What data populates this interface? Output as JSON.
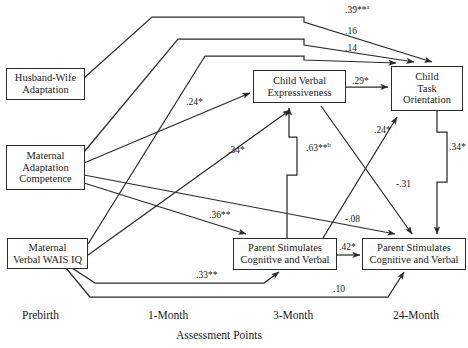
{
  "figure": {
    "type": "path-diagram",
    "axis_title": "Assessment Points",
    "axis_points": [
      {
        "label": "Prebirth",
        "x": 48
      },
      {
        "label": "1-Month",
        "x": 175
      },
      {
        "label": "3-Month",
        "x": 300
      },
      {
        "label": "24-Month",
        "x": 424
      }
    ]
  },
  "nodes": {
    "husband_wife": "Husband-Wife\nAdaptation",
    "maternal_adaptation": "Maternal\nAdaptation\nCompetence",
    "maternal_wais": "Maternal\nVerbal WAIS IQ",
    "child_verbal": "Child Verbal\nExpressiveness",
    "child_task": "Child\nTask\nOrientation",
    "parent_stim_3mo": "Parent Stimulates\nCognitive and Verbal",
    "parent_stim_24mo": "Parent Stimulates\nCognitive and Verbal"
  },
  "paths": [
    {
      "id": "hw-to-task",
      "coefficient": ".39",
      "stars": "**",
      "note": "a",
      "from": "husband_wife",
      "to": "child_task"
    },
    {
      "id": "madapt-to-task",
      "coefficient": ".16",
      "stars": "",
      "note": "",
      "from": "maternal_adaptation",
      "to": "child_task"
    },
    {
      "id": "wais-to-task",
      "coefficient": ".14",
      "stars": "",
      "note": "",
      "from": "maternal_wais",
      "to": "child_task"
    },
    {
      "id": "madapt-to-verbal",
      "coefficient": ".24",
      "stars": "*",
      "note": "",
      "from": "maternal_adaptation",
      "to": "child_verbal"
    },
    {
      "id": "wais-to-verbal",
      "coefficient": ".34",
      "stars": "*",
      "note": "",
      "from": "maternal_wais",
      "to": "child_verbal"
    },
    {
      "id": "verbal-to-task",
      "coefficient": ".29",
      "stars": "*",
      "note": "",
      "from": "child_verbal",
      "to": "child_task"
    },
    {
      "id": "pstim3-to-verbal",
      "coefficient": ".63",
      "stars": "**",
      "note": "b",
      "from": "parent_stim_3mo",
      "to": "child_verbal"
    },
    {
      "id": "pstim3-to-task",
      "coefficient": ".24",
      "stars": "*",
      "note": "",
      "from": "parent_stim_3mo",
      "to": "child_task"
    },
    {
      "id": "task-to-pstim24",
      "coefficient": ".34",
      "stars": "*",
      "note": "",
      "from": "child_task",
      "to": "parent_stim_24mo"
    },
    {
      "id": "verbal-to-pstim24",
      "coefficient": "-.31",
      "stars": "",
      "note": "",
      "from": "child_verbal",
      "to": "parent_stim_24mo"
    },
    {
      "id": "madapt-to-pstim3",
      "coefficient": ".36",
      "stars": "**",
      "note": "",
      "from": "maternal_adaptation",
      "to": "parent_stim_3mo"
    },
    {
      "id": "madapt-to-pstim24",
      "coefficient": "-.08",
      "stars": "",
      "note": "",
      "from": "maternal_adaptation",
      "to": "parent_stim_24mo"
    },
    {
      "id": "pstim3-to-pstim24",
      "coefficient": ".42",
      "stars": "*",
      "note": "",
      "from": "parent_stim_3mo",
      "to": "parent_stim_24mo"
    },
    {
      "id": "wais-to-pstim3",
      "coefficient": ".33",
      "stars": "**",
      "note": "",
      "from": "maternal_wais",
      "to": "parent_stim_3mo"
    },
    {
      "id": "wais-to-pstim24",
      "coefficient": ".10",
      "stars": "",
      "note": "",
      "from": "maternal_wais",
      "to": "parent_stim_24mo"
    }
  ],
  "colors": {
    "line": "#2b2b2b",
    "box_border": "#2b2b2b",
    "background": "#ffffff",
    "text": "#1a1a1a"
  }
}
